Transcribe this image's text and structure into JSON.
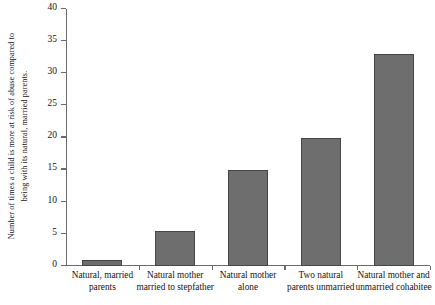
{
  "chart_data": {
    "type": "bar",
    "title": "",
    "xlabel": "",
    "ylabel_line1": "Number of times a child is more at risk of abuse compared to",
    "ylabel_line2": "being with its natural, married parents.",
    "categories": [
      "Natural, married parents",
      "Natural mother married to stepfather",
      "Natural mother alone",
      "Two natural parents unmarried",
      "Natural mother and unmarried cohabitee"
    ],
    "category_lines": [
      [
        "Natural, married",
        "parents"
      ],
      [
        "Natural mother",
        "married to stepfather"
      ],
      [
        "Natural mother",
        "alone"
      ],
      [
        "Two natural",
        "parents unmarried"
      ],
      [
        "Natural mother and",
        "unmarried cohabitee"
      ]
    ],
    "values": [
      1,
      5.5,
      15,
      20,
      33
    ],
    "ylim": [
      0,
      40
    ],
    "yticks": [
      0,
      5,
      10,
      15,
      20,
      25,
      30,
      35,
      40
    ],
    "ytick_labels": [
      "0",
      "5",
      "10",
      "15",
      "20",
      "25",
      "30",
      "35",
      "40"
    ],
    "grid": false,
    "legend": false,
    "bar_color": "#6e6e6e",
    "bar_border_color": "#454545",
    "axis_color": "#6b6b6b",
    "background": "#ffffff"
  }
}
